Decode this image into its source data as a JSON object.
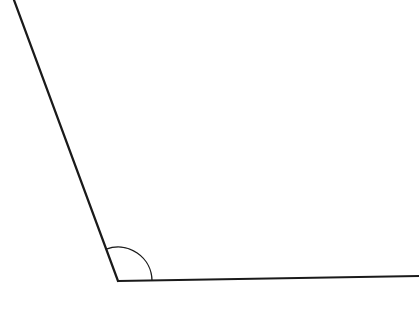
{
  "diagram": {
    "type": "angle",
    "background": "#ffffff",
    "stroke_color": "#1a1a1a",
    "vertex": {
      "x": 118,
      "y": 281
    },
    "ray_left_end": {
      "x": 14,
      "y": 0
    },
    "ray_right_end": {
      "x": 419,
      "y": 276
    },
    "arc_radius": 34,
    "angle_marker": "arc"
  }
}
